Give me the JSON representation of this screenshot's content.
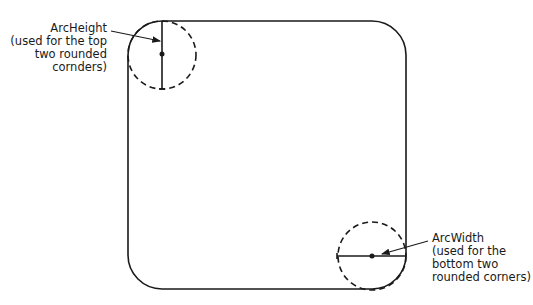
{
  "diagram": {
    "arc_height_label": {
      "title": "ArcHeight",
      "lines": [
        "(used for the top",
        "two rounded",
        "cornders)"
      ]
    },
    "arc_width_label": {
      "title": "ArcWidth",
      "lines": [
        "(used for the",
        "bottom two",
        "rounded corners)"
      ]
    },
    "colors": {
      "stroke": "#1a1a1a",
      "background": "#ffffff"
    }
  }
}
